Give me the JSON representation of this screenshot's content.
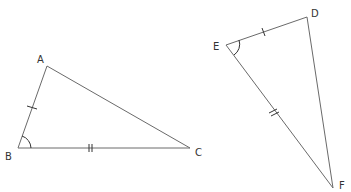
{
  "diagram": {
    "type": "geometry",
    "triangles": [
      {
        "name": "ABC",
        "vertices": {
          "A": {
            "label": "A",
            "x": 47,
            "y": 66
          },
          "B": {
            "label": "B",
            "x": 18,
            "y": 148
          },
          "C": {
            "label": "C",
            "x": 190,
            "y": 148
          }
        },
        "marks": [
          {
            "side": "AB",
            "ticks": 1
          },
          {
            "side": "BC",
            "ticks": 2
          },
          {
            "angle": "B",
            "arcs": 1
          }
        ]
      },
      {
        "name": "EDF",
        "vertices": {
          "E": {
            "label": "E",
            "x": 226,
            "y": 45
          },
          "D": {
            "label": "D",
            "x": 307,
            "y": 17
          },
          "F": {
            "label": "F",
            "x": 333,
            "y": 188
          }
        },
        "marks": [
          {
            "side": "ED",
            "ticks": 1
          },
          {
            "side": "EF",
            "ticks": 2
          },
          {
            "angle": "E",
            "arcs": 1
          }
        ]
      }
    ],
    "labels": {
      "A": "A",
      "B": "B",
      "C": "C",
      "D": "D",
      "E": "E",
      "F": "F"
    },
    "colors": {
      "line": "#6a6a6a",
      "mark": "#333333",
      "background": "#ffffff"
    }
  }
}
